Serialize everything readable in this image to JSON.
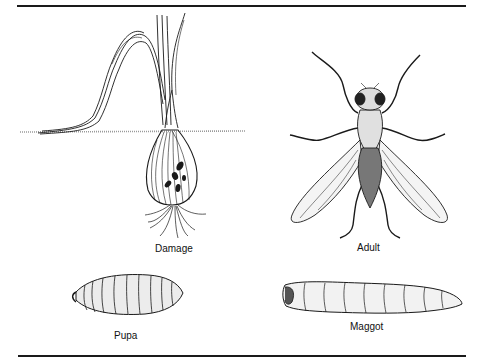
{
  "figure": {
    "panels": [
      {
        "id": "damage",
        "label": "Damage",
        "subject": "onion-plant-with-damaged-bulb"
      },
      {
        "id": "adult",
        "label": "Adult",
        "subject": "adult-fly"
      },
      {
        "id": "pupa",
        "label": "Pupa",
        "subject": "pupa"
      },
      {
        "id": "maggot",
        "label": "Maggot",
        "subject": "maggot-larva"
      }
    ],
    "colors": {
      "ink": "#1a1a1a",
      "background": "#ffffff",
      "stipple": "#8a8a8a"
    }
  }
}
